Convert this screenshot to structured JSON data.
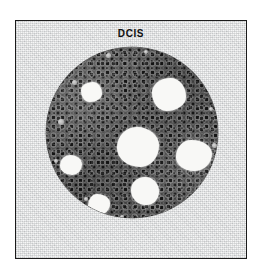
{
  "figure": {
    "title": "DCIS",
    "caption_label": "DCIS",
    "panel": {
      "border_color": "#1b1b1b",
      "background_color": "#e9eaea",
      "x": 15,
      "y": 20,
      "width": 232,
      "height": 239
    },
    "duct": {
      "name": "duct-cross-section",
      "fill_color": "#4a4a4a",
      "rim_color": "#bdbdbd",
      "center_x": 116,
      "center_y": 112,
      "diameter": 172
    },
    "lumens": [
      {
        "id": "lumen-center",
        "x": 71,
        "y": 80,
        "w": 42,
        "h": 40,
        "shape": "l1"
      },
      {
        "id": "lumen-upper-right",
        "x": 106,
        "y": 31,
        "w": 34,
        "h": 33,
        "shape": "l2"
      },
      {
        "id": "lumen-right",
        "x": 130,
        "y": 93,
        "w": 36,
        "h": 31,
        "shape": "l3"
      },
      {
        "id": "lumen-lower-mid",
        "x": 85,
        "y": 130,
        "w": 28,
        "h": 28,
        "shape": "l4"
      },
      {
        "id": "lumen-upper-left",
        "x": 35,
        "y": 35,
        "w": 21,
        "h": 20,
        "shape": "l2"
      },
      {
        "id": "lumen-left",
        "x": 14,
        "y": 108,
        "w": 22,
        "h": 20,
        "shape": "l1"
      },
      {
        "id": "lumen-bottom-left",
        "x": 42,
        "y": 147,
        "w": 22,
        "h": 21,
        "shape": "l3"
      }
    ],
    "rim_dots": [
      {
        "x": 12,
        "y": 72,
        "d": 6
      },
      {
        "x": 26,
        "y": 33,
        "d": 5
      },
      {
        "x": 60,
        "y": 6,
        "d": 5
      },
      {
        "x": 98,
        "y": 3,
        "d": 4
      },
      {
        "x": 146,
        "y": 12,
        "d": 4
      },
      {
        "x": 163,
        "y": 60,
        "d": 4
      },
      {
        "x": 166,
        "y": 96,
        "d": 5
      },
      {
        "x": 152,
        "y": 138,
        "d": 4
      },
      {
        "x": 118,
        "y": 163,
        "d": 5
      },
      {
        "x": 74,
        "y": 168,
        "d": 4
      },
      {
        "x": 38,
        "y": 150,
        "d": 4
      },
      {
        "x": 8,
        "y": 112,
        "d": 4
      }
    ]
  }
}
